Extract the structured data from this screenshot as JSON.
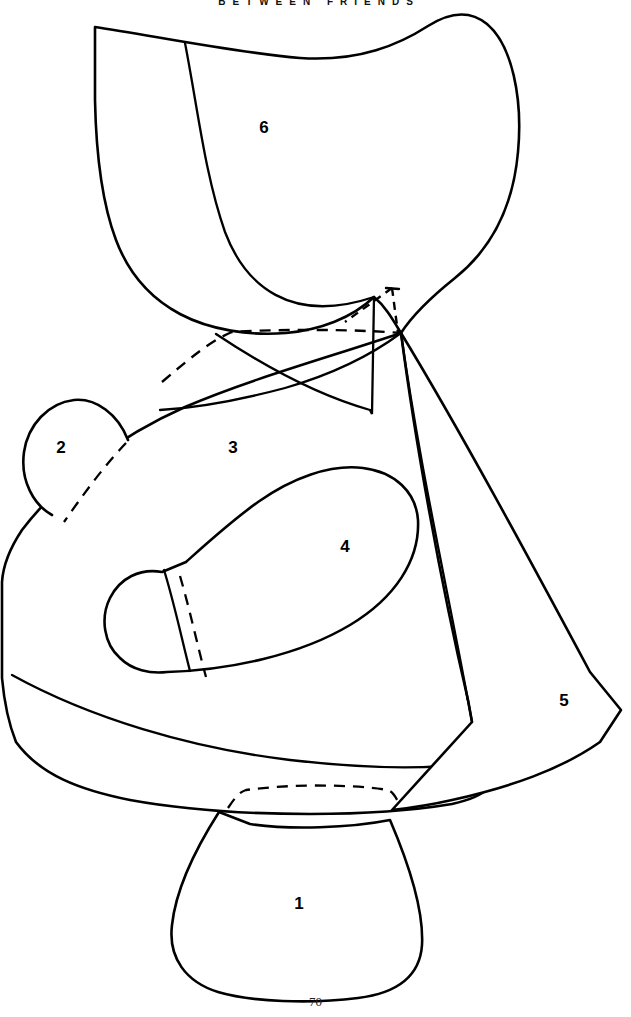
{
  "page": {
    "header_title": "BETWEEN FRIENDS",
    "page_number": "70",
    "background_color": "#ffffff",
    "line_color": "#000000",
    "width": 631,
    "height": 1017
  },
  "pattern": {
    "type": "sewing-pattern-line-art",
    "stroke_width_outline": 2.6,
    "stroke_width_inner": 2.2,
    "dash_pattern": "11 8",
    "pieces": [
      {
        "id": "piece-1",
        "label": "1",
        "label_x": 299,
        "label_y": 903,
        "description": "rounded pouch / base piece with dashed top seam"
      },
      {
        "id": "piece-2",
        "label": "2",
        "label_x": 61,
        "label_y": 447,
        "description": "small teardrop ear tab with dashed seam allowance"
      },
      {
        "id": "piece-3",
        "label": "3",
        "label_x": 233,
        "label_y": 447,
        "description": "large body / skirt panel with hem band"
      },
      {
        "id": "piece-4",
        "label": "4",
        "label_x": 345,
        "label_y": 546,
        "description": "shoe / mitten shape with cuff line and dashed fold line"
      },
      {
        "id": "piece-5",
        "label": "5",
        "label_x": 564,
        "label_y": 700,
        "description": "narrow side wedge panel"
      },
      {
        "id": "piece-6",
        "label": "6",
        "label_x": 264,
        "label_y": 127,
        "description": "bonnet / hood crown with internal seam curve"
      }
    ]
  }
}
